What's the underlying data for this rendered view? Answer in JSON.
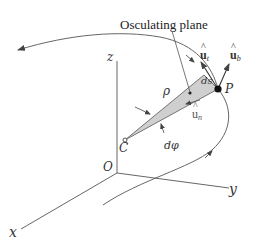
{
  "diagram": {
    "title_label": "Osculating plane",
    "axes": {
      "x": "x",
      "y": "y",
      "z": "z",
      "origin": "O"
    },
    "points": {
      "center": "C",
      "point": "P"
    },
    "symbols": {
      "radius": "ρ",
      "arc_length": "ds",
      "angle": "dφ"
    },
    "vectors": {
      "tangent": {
        "base": "u",
        "hat": "^",
        "sub": "t"
      },
      "normal": {
        "base": "u",
        "hat": "^",
        "sub": "n"
      },
      "binormal": {
        "base": "u",
        "hat": "^",
        "sub": "b"
      }
    },
    "colors": {
      "line": "#555555",
      "plane_fill": "#cfcfcf",
      "text": "#333333",
      "point": "#111111"
    }
  }
}
